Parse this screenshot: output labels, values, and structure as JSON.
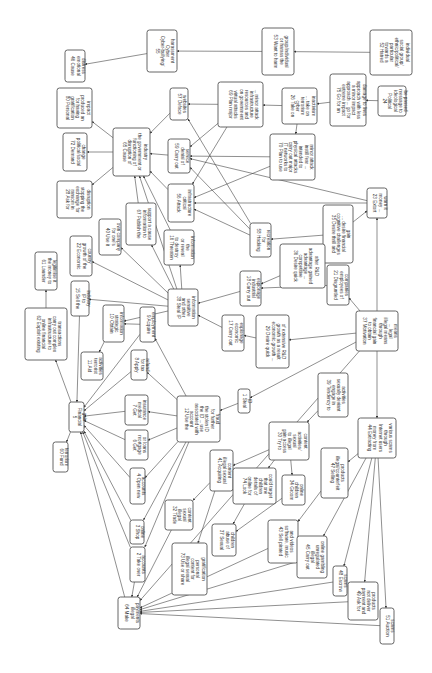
{
  "diagram": {
    "orientation": "rotated-90-clockwise",
    "colors": {
      "background": "#ffffff",
      "node_border": "#555555",
      "edge": "#444444",
      "text": "#333333"
    },
    "nodes": [
      {
        "id": "55",
        "label": "55 Cyber-bullying/ Cyber harassment",
        "x": 147,
        "y": 30,
        "w": 30,
        "h": 42
      },
      {
        "id": "46",
        "label": "46 Cause emotional distress",
        "x": 65,
        "y": 50,
        "w": 20,
        "h": 32
      },
      {
        "id": "53",
        "label": "53 Want to harm or harass the group/individual",
        "x": 262,
        "y": 28,
        "w": 32,
        "h": 47
      },
      {
        "id": "52",
        "label": "52 Hatred towards a particular ethnic/political/ social group/ individual",
        "x": 370,
        "y": 30,
        "w": 42,
        "h": 45
      },
      {
        "id": "80",
        "label": "80 Personal gratification for having produced an impact",
        "x": 57,
        "y": 88,
        "w": 35,
        "h": 40
      },
      {
        "id": "57",
        "label": "57 Deface websites",
        "x": 170,
        "y": 88,
        "w": 18,
        "h": 32
      },
      {
        "id": "69",
        "label": "69 Plan major virtual attacks on government resources and infrastructure ... minor attack",
        "x": 218,
        "y": 82,
        "w": 45,
        "h": 45
      },
      {
        "id": "26",
        "label": "26 Take on cyber terrorism ... take on inactivism",
        "x": 282,
        "y": 88,
        "w": 35,
        "h": 36
      },
      {
        "id": "75",
        "label": "75 Go for an extreme impact approach ... go for a minor impact approach with less damage to lives",
        "x": 330,
        "y": 74,
        "w": 36,
        "h": 52
      },
      {
        "id": "24",
        "label": "24 Political ideological message to be passed",
        "x": 378,
        "y": 86,
        "w": 28,
        "h": 30
      },
      {
        "id": "72",
        "label": "72 Demand political/social change",
        "x": 63,
        "y": 133,
        "w": 24,
        "h": 38
      },
      {
        "id": "65",
        "label": "65 Cause disruption of functioning of the government or industry",
        "x": 113,
        "y": 128,
        "w": 37,
        "h": 48
      },
      {
        "id": "59",
        "label": "59 Carry out denial of service",
        "x": 168,
        "y": 139,
        "w": 22,
        "h": 34
      },
      {
        "id": "70",
        "label": "70 Plan to use IT networks to carry out major physical attacks intended to instill fear ... minor attack",
        "x": 270,
        "y": 134,
        "w": 45,
        "h": 46
      },
      {
        "id": "28",
        "label": "28 Ask for ransom in exchange for stopping the disruption",
        "x": 57,
        "y": 181,
        "w": 35,
        "h": 37
      },
      {
        "id": "56",
        "label": "56 Attack critical infrastructure",
        "x": 168,
        "y": 184,
        "w": 26,
        "h": 38
      },
      {
        "id": "23",
        "label": "23 Extort money ... warn it",
        "x": 367,
        "y": 188,
        "w": 20,
        "h": 30
      },
      {
        "id": "40",
        "label": "40 Use it for one's own company",
        "x": 99,
        "y": 219,
        "w": 22,
        "h": 36
      },
      {
        "id": "67",
        "label": "67 Publish the information to support a cause",
        "x": 126,
        "y": 203,
        "w": 30,
        "h": 42
      },
      {
        "id": "16",
        "label": "16 Threaten to destroy or reveal the information",
        "x": 164,
        "y": 230,
        "w": 30,
        "h": 35
      },
      {
        "id": "58",
        "label": "58 Hacking for recreation",
        "x": 250,
        "y": 223,
        "w": 21,
        "h": 34
      },
      {
        "id": "35",
        "label": "35 Desire thrill and cognitive challenges ... desire financial gain",
        "x": 323,
        "y": 205,
        "w": 30,
        "h": 58
      },
      {
        "id": "22",
        "label": "22 Economic growth of the country",
        "x": 70,
        "y": 236,
        "w": 22,
        "h": 40
      },
      {
        "id": "61",
        "label": "61 Launder the money to legitimise it",
        "x": 35,
        "y": 252,
        "w": 22,
        "h": 38
      },
      {
        "id": "36",
        "label": "36 Desire quick competitive advantage ... advantage gained after R&D",
        "x": 280,
        "y": 244,
        "w": 45,
        "h": 44
      },
      {
        "id": "18",
        "label": "18 Carry out industrial espionage",
        "x": 240,
        "y": 271,
        "w": 21,
        "h": 35
      },
      {
        "id": "21",
        "label": "21 Disgruntled employees of companies",
        "x": 327,
        "y": 265,
        "w": 22,
        "h": 40
      },
      {
        "id": "15",
        "label": "15 Sell the IP to industry",
        "x": 71,
        "y": 281,
        "w": 18,
        "h": 35
      },
      {
        "id": "62",
        "label": "62 Exploit existing online financial infrastructure to carry out complex transactions",
        "x": 25,
        "y": 308,
        "w": 42,
        "h": 52
      },
      {
        "id": "38",
        "label": "38 Steal IP and other sensitive information",
        "x": 168,
        "y": 289,
        "w": 30,
        "h": 37
      },
      {
        "id": "10",
        "label": "10 Obtain strategic information",
        "x": 103,
        "y": 305,
        "w": 21,
        "h": 37
      },
      {
        "id": "9",
        "label": "9 Acquire employment",
        "x": 140,
        "y": 307,
        "w": 15,
        "h": 35
      },
      {
        "id": "17",
        "label": "17 Carry out economic espionage",
        "x": 222,
        "y": 315,
        "w": 22,
        "h": 36
      },
      {
        "id": "29",
        "label": "29 Desire quick economic growth ... growth as a result of extensive R&D",
        "x": 256,
        "y": 315,
        "w": 33,
        "h": 53
      },
      {
        "id": "37",
        "label": "37 Motivation to obtain financial gain through illegal means ... legal means",
        "x": 356,
        "y": 311,
        "w": 42,
        "h": 40
      },
      {
        "id": "11",
        "label": "11 Aid terrorist activities",
        "x": 81,
        "y": 352,
        "w": 22,
        "h": 28
      },
      {
        "id": "8",
        "label": "8 Apply for tax refund",
        "x": 131,
        "y": 350,
        "w": 16,
        "h": 30
      },
      {
        "id": "1",
        "label": "1 Steal ID",
        "x": 238,
        "y": 389,
        "w": 12,
        "h": 24
      },
      {
        "id": "39",
        "label": "39 Tendency to engage in sexually deviant activities",
        "x": 318,
        "y": 373,
        "w": 30,
        "h": 44
      },
      {
        "id": "5",
        "label": "5 Financial gain",
        "x": 69,
        "y": 402,
        "w": 15,
        "h": 30
      },
      {
        "id": "7",
        "label": "7 Get medical insurance",
        "x": 125,
        "y": 395,
        "w": 23,
        "h": 30
      },
      {
        "id": "12",
        "label": "12 Use the account associated with the ID ... use the stolen ID for further fraud",
        "x": 177,
        "y": 396,
        "w": 43,
        "h": 46
      },
      {
        "id": "30",
        "label": "30 Try to gain access to illegal sexual activities/ content",
        "x": 269,
        "y": 422,
        "w": 40,
        "h": 38
      },
      {
        "id": "60",
        "label": "60 Fund terrorism",
        "x": 53,
        "y": 442,
        "w": 15,
        "h": 30
      },
      {
        "id": "6",
        "label": "6 Get mortgage or loans",
        "x": 125,
        "y": 430,
        "w": 23,
        "h": 30
      },
      {
        "id": "41",
        "label": "41 Acquiring illegal sexual content",
        "x": 210,
        "y": 450,
        "w": 23,
        "h": 41
      },
      {
        "id": "74",
        "label": "74 Look online for details of children that one could target",
        "x": 233,
        "y": 468,
        "w": 43,
        "h": 36
      },
      {
        "id": "34",
        "label": "34 Groom children online",
        "x": 282,
        "y": 475,
        "w": 23,
        "h": 30
      },
      {
        "id": "44",
        "label": "44 Extracting money from Internet users through various scams",
        "x": 358,
        "y": 418,
        "w": 38,
        "h": 40
      },
      {
        "id": "4",
        "label": "4 Open new accounts",
        "x": 130,
        "y": 468,
        "w": 15,
        "h": 36
      },
      {
        "id": "47",
        "label": "47 Selling illegal/counterfeit products",
        "x": 321,
        "y": 448,
        "w": 27,
        "h": 50
      },
      {
        "id": "32",
        "label": "32 Trade illegal sexual content",
        "x": 165,
        "y": 500,
        "w": 28,
        "h": 30
      },
      {
        "id": "3",
        "label": "3 Shop online",
        "x": 130,
        "y": 520,
        "w": 14,
        "h": 24
      },
      {
        "id": "37b",
        "label": "37 Sexual abuse of children",
        "x": 212,
        "y": 524,
        "w": 24,
        "h": 32
      },
      {
        "id": "43",
        "label": "43 Sell pirated software, music and videos",
        "x": 268,
        "y": 520,
        "w": 30,
        "h": 43
      },
      {
        "id": "73",
        "label": "73 Use or share illegal sexual content for personal gratification",
        "x": 172,
        "y": 543,
        "w": 35,
        "h": 52
      },
      {
        "id": "45",
        "label": "45 Carry out illegal unregulated online gambling",
        "x": 297,
        "y": 536,
        "w": 30,
        "h": 42
      },
      {
        "id": "2",
        "label": "2 Take over accounts",
        "x": 130,
        "y": 547,
        "w": 15,
        "h": 35
      },
      {
        "id": "48",
        "label": "48 Escrow scams",
        "x": 333,
        "y": 566,
        "w": 14,
        "h": 30
      },
      {
        "id": "49",
        "label": "49 Ask for payment and not deliver products",
        "x": 348,
        "y": 582,
        "w": 30,
        "h": 38
      },
      {
        "id": "64",
        "label": "64 Make illegal payments",
        "x": 118,
        "y": 597,
        "w": 22,
        "h": 32
      },
      {
        "id": "51",
        "label": "51 Auction scams",
        "x": 380,
        "y": 608,
        "w": 14,
        "h": 36
      }
    ],
    "edges": [
      [
        "52",
        "53"
      ],
      [
        "53",
        "55"
      ],
      [
        "55",
        "46"
      ],
      [
        "24",
        "75"
      ],
      [
        "75",
        "26"
      ],
      [
        "26",
        "69"
      ],
      [
        "26",
        "70"
      ],
      [
        "69",
        "57"
      ],
      [
        "69",
        "59"
      ],
      [
        "69",
        "56"
      ],
      [
        "70",
        "56"
      ],
      [
        "70",
        "59"
      ],
      [
        "65",
        "80"
      ],
      [
        "65",
        "72"
      ],
      [
        "65",
        "28"
      ],
      [
        "57",
        "65"
      ],
      [
        "59",
        "65"
      ],
      [
        "56",
        "65"
      ],
      [
        "67",
        "65"
      ],
      [
        "16",
        "65"
      ],
      [
        "38",
        "65"
      ],
      [
        "58",
        "57"
      ],
      [
        "58",
        "59"
      ],
      [
        "58",
        "56"
      ],
      [
        "35",
        "58"
      ],
      [
        "35",
        "23"
      ],
      [
        "23",
        "56"
      ],
      [
        "23",
        "59"
      ],
      [
        "37",
        "23"
      ],
      [
        "38",
        "40"
      ],
      [
        "38",
        "67"
      ],
      [
        "38",
        "16"
      ],
      [
        "38",
        "22"
      ],
      [
        "38",
        "15"
      ],
      [
        "38",
        "10"
      ],
      [
        "18",
        "38"
      ],
      [
        "17",
        "38"
      ],
      [
        "36",
        "18"
      ],
      [
        "29",
        "17"
      ],
      [
        "21",
        "18"
      ],
      [
        "37",
        "21"
      ],
      [
        "10",
        "11"
      ],
      [
        "9",
        "10"
      ],
      [
        "9",
        "5"
      ],
      [
        "15",
        "5"
      ],
      [
        "62",
        "61"
      ],
      [
        "5",
        "62"
      ],
      [
        "5",
        "60"
      ],
      [
        "12",
        "9"
      ],
      [
        "12",
        "8"
      ],
      [
        "12",
        "7"
      ],
      [
        "12",
        "6"
      ],
      [
        "12",
        "4"
      ],
      [
        "12",
        "3"
      ],
      [
        "12",
        "2"
      ],
      [
        "8",
        "5"
      ],
      [
        "7",
        "5"
      ],
      [
        "6",
        "5"
      ],
      [
        "4",
        "5"
      ],
      [
        "3",
        "5"
      ],
      [
        "2",
        "5"
      ],
      [
        "64",
        "5"
      ],
      [
        "1",
        "12"
      ],
      [
        "37",
        "1"
      ],
      [
        "37",
        "44"
      ],
      [
        "39",
        "30"
      ],
      [
        "37",
        "29"
      ],
      [
        "30",
        "41"
      ],
      [
        "30",
        "34"
      ],
      [
        "30",
        "74"
      ],
      [
        "41",
        "32"
      ],
      [
        "41",
        "73"
      ],
      [
        "74",
        "37b"
      ],
      [
        "34",
        "37b"
      ],
      [
        "44",
        "47"
      ],
      [
        "44",
        "45"
      ],
      [
        "44",
        "48"
      ],
      [
        "44",
        "49"
      ],
      [
        "44",
        "51"
      ],
      [
        "47",
        "43"
      ],
      [
        "43",
        "64"
      ],
      [
        "45",
        "64"
      ],
      [
        "48",
        "64"
      ],
      [
        "49",
        "64"
      ],
      [
        "51",
        "64"
      ],
      [
        "32",
        "64"
      ],
      [
        "2",
        "64"
      ],
      [
        "37",
        "64"
      ]
    ]
  }
}
